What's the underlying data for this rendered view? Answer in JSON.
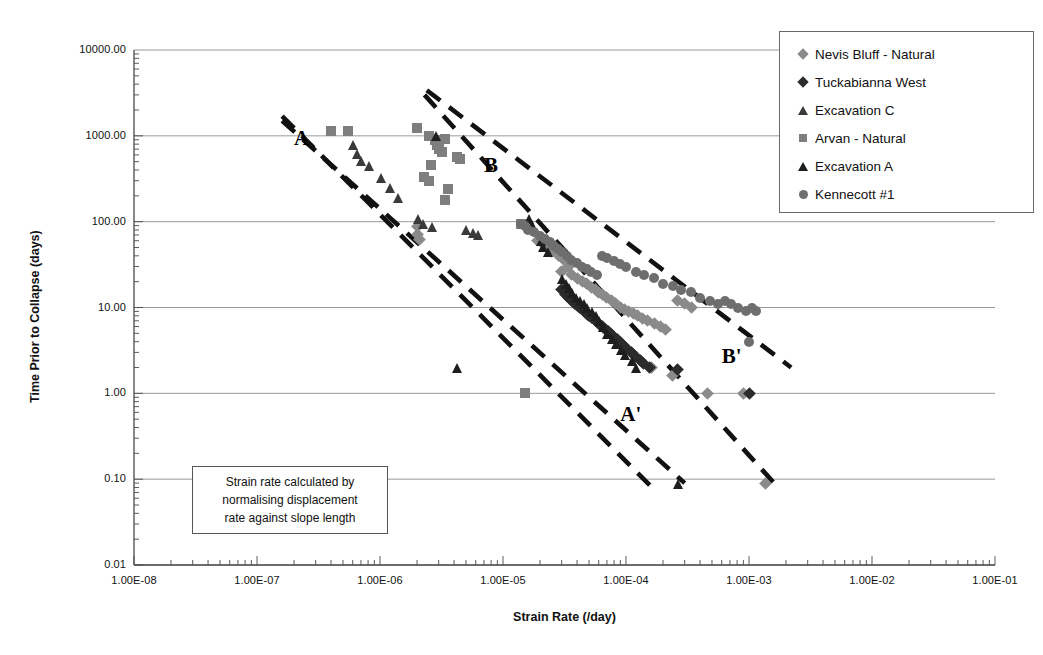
{
  "chart_data": {
    "type": "scatter",
    "title": "",
    "xlabel": "Strain Rate (/day)",
    "ylabel": "Time Prior to Collapse (days)",
    "xscale": "log",
    "yscale": "log",
    "xlim": [
      1e-08,
      0.1
    ],
    "ylim": [
      0.01,
      10000
    ],
    "grid": "horizontal-major",
    "legend_position": "top-right",
    "xtick_labels": [
      "1.00E-08",
      "1.00E-07",
      "1.00E-06",
      "1.00E-05",
      "1.00E-04",
      "1.00E-03",
      "1.00E-02",
      "1.00E-01"
    ],
    "xtick_values": [
      1e-08,
      1e-07,
      1e-06,
      1e-05,
      0.0001,
      0.001,
      0.01,
      0.1
    ],
    "ytick_labels": [
      "10000.00",
      "1000.00",
      "100.00",
      "10.00",
      "1.00",
      "0.10",
      "0.01"
    ],
    "ytick_values": [
      10000,
      1000,
      100,
      10,
      1,
      0.1,
      0.01
    ],
    "annotations": [
      {
        "text": "A",
        "x": 2e-07,
        "y": 900,
        "note": "upper bound line start label"
      },
      {
        "text": "B",
        "x": 7e-06,
        "y": 430,
        "note": "upper envelope line label"
      },
      {
        "text": "A'",
        "x": 9e-05,
        "y": 0.55,
        "note": "lower end of line A"
      },
      {
        "text": "B'",
        "x": 0.0006,
        "y": 2.6,
        "note": "lower end of line B"
      }
    ],
    "trend_lines": [
      {
        "name": "A-A'",
        "style": "dashed",
        "points": [
          [
            1.6e-07,
            1700
          ],
          [
            0.00017,
            0.075
          ]
        ]
      },
      {
        "name": "A-A'-lower",
        "style": "dashed",
        "points": [
          [
            1.6e-07,
            1500
          ],
          [
            0.0003,
            0.09
          ]
        ]
      },
      {
        "name": "B-B'",
        "style": "dashed",
        "points": [
          [
            2.3e-06,
            3000
          ],
          [
            0.0016,
            0.09
          ]
        ]
      },
      {
        "name": "B-B'-upper",
        "style": "dashed",
        "points": [
          [
            2.4e-06,
            3400
          ],
          [
            0.0022,
            2.0
          ]
        ]
      }
    ],
    "series": [
      {
        "name": "Nevis Bluff - Natural",
        "marker": "diamond",
        "color": "#8a8a8a",
        "points": [
          [
            2e-06,
            88
          ],
          [
            2e-06,
            70
          ],
          [
            2.1e-06,
            62
          ],
          [
            1.9e-05,
            60
          ],
          [
            2.2e-05,
            52
          ],
          [
            2.5e-05,
            45
          ],
          [
            2.8e-05,
            40
          ],
          [
            3.1e-05,
            36
          ],
          [
            3.4e-05,
            30
          ],
          [
            3e-05,
            26
          ],
          [
            3.6e-05,
            24
          ],
          [
            4e-05,
            22
          ],
          [
            4.4e-05,
            20
          ],
          [
            4.8e-05,
            19
          ],
          [
            5.2e-05,
            17
          ],
          [
            5.6e-05,
            16
          ],
          [
            6e-05,
            15
          ],
          [
            6.5e-05,
            14
          ],
          [
            7e-05,
            13
          ],
          [
            7.6e-05,
            12
          ],
          [
            8.2e-05,
            11
          ],
          [
            9e-05,
            10
          ],
          [
            9.8e-05,
            9.5
          ],
          [
            0.000105,
            9.0
          ],
          [
            0.000115,
            8.5
          ],
          [
            0.000125,
            8.0
          ],
          [
            0.000135,
            7.5
          ],
          [
            0.00015,
            7.0
          ],
          [
            0.00017,
            6.5
          ],
          [
            0.00019,
            6.0
          ],
          [
            0.00021,
            5.5
          ],
          [
            0.00011,
            3.0
          ],
          [
            0.00012,
            2.7
          ],
          [
            0.00016,
            2.0
          ],
          [
            0.00024,
            1.6
          ],
          [
            0.00046,
            1.0
          ],
          [
            0.0009,
            1.0
          ],
          [
            0.00135,
            0.09
          ],
          [
            0.00026,
            12
          ],
          [
            0.0003,
            11
          ],
          [
            0.00034,
            10
          ]
        ]
      },
      {
        "name": "Tuckabianna West",
        "marker": "diamond",
        "color": "#2b2b2b",
        "points": [
          [
            3e-05,
            16
          ],
          [
            3.2e-05,
            14
          ],
          [
            3.4e-05,
            13
          ],
          [
            3.6e-05,
            12
          ],
          [
            3.8e-05,
            11
          ],
          [
            4e-05,
            10.5
          ],
          [
            4.2e-05,
            10
          ],
          [
            4.4e-05,
            9.5
          ],
          [
            4.6e-05,
            9.0
          ],
          [
            4.8e-05,
            8.5
          ],
          [
            5e-05,
            8.0
          ],
          [
            5.2e-05,
            7.6
          ],
          [
            5.5e-05,
            7.2
          ],
          [
            5.8e-05,
            6.8
          ],
          [
            6.1e-05,
            6.4
          ],
          [
            6.4e-05,
            6.0
          ],
          [
            6.8e-05,
            5.6
          ],
          [
            7.2e-05,
            5.2
          ],
          [
            7.6e-05,
            4.8
          ],
          [
            8e-05,
            4.5
          ],
          [
            8.5e-05,
            4.2
          ],
          [
            9e-05,
            3.9
          ],
          [
            9.5e-05,
            3.6
          ],
          [
            0.0001,
            3.3
          ],
          [
            0.00011,
            3.0
          ],
          [
            0.00012,
            2.7
          ],
          [
            0.00013,
            2.4
          ],
          [
            0.00014,
            2.2
          ],
          [
            0.000155,
            2.0
          ],
          [
            0.00026,
            1.9
          ],
          [
            0.001,
            1.0
          ]
        ]
      },
      {
        "name": "Excavation C",
        "marker": "triangle",
        "color": "#3a3a3a",
        "points": [
          [
            6e-07,
            800
          ],
          [
            6.5e-07,
            620
          ],
          [
            7e-07,
            520
          ],
          [
            8e-07,
            450
          ],
          [
            1e-06,
            330
          ],
          [
            1.2e-06,
            250
          ],
          [
            1.4e-06,
            190
          ],
          [
            2e-06,
            110
          ],
          [
            2.2e-06,
            95
          ],
          [
            2.6e-06,
            88
          ],
          [
            5e-06,
            80
          ],
          [
            5.6e-06,
            75
          ],
          [
            6.2e-06,
            70
          ]
        ]
      },
      {
        "name": "Arvan - Natural",
        "marker": "square",
        "color": "#7e7e7e",
        "points": [
          [
            4e-07,
            1150
          ],
          [
            5.5e-07,
            1150
          ],
          [
            2e-06,
            1250
          ],
          [
            2.5e-06,
            1000
          ],
          [
            2.8e-06,
            900
          ],
          [
            2.9e-06,
            780
          ],
          [
            3.4e-06,
            920
          ],
          [
            3e-06,
            700
          ],
          [
            3.2e-06,
            640
          ],
          [
            4.2e-06,
            560
          ],
          [
            4.5e-06,
            540
          ],
          [
            2.6e-06,
            460
          ],
          [
            2.3e-06,
            330
          ],
          [
            2.5e-06,
            300
          ],
          [
            3.6e-06,
            240
          ],
          [
            3.4e-06,
            180
          ],
          [
            1.4e-05,
            95
          ],
          [
            1.5e-05,
            1.0
          ]
        ]
      },
      {
        "name": "Excavation A",
        "marker": "triangle",
        "color": "#1e1e1e",
        "points": [
          [
            2.8e-06,
            1000
          ],
          [
            1.6e-05,
            110
          ],
          [
            1.7e-05,
            92
          ],
          [
            2e-05,
            60
          ],
          [
            2.1e-05,
            52
          ],
          [
            2.3e-05,
            45
          ],
          [
            3e-05,
            22
          ],
          [
            3.2e-05,
            19
          ],
          [
            3.4e-05,
            17
          ],
          [
            3.6e-05,
            15
          ],
          [
            3.9e-05,
            13
          ],
          [
            4.2e-05,
            12
          ],
          [
            4.5e-05,
            11
          ],
          [
            4.8e-05,
            10
          ],
          [
            5.2e-05,
            9
          ],
          [
            5.6e-05,
            8
          ],
          [
            6e-05,
            7
          ],
          [
            6.5e-05,
            6
          ],
          [
            7e-05,
            5
          ],
          [
            7.6e-05,
            4.4
          ],
          [
            8.2e-05,
            3.8
          ],
          [
            9e-05,
            3.2
          ],
          [
            9.8e-05,
            2.8
          ],
          [
            0.00011,
            2.4
          ],
          [
            0.00012,
            2.0
          ],
          [
            4.2e-06,
            2.0
          ],
          [
            0.00026,
            0.09
          ]
        ]
      },
      {
        "name": "Kennecott #1",
        "marker": "circle",
        "color": "#6e6e6e",
        "points": [
          [
            1.4e-05,
            95
          ],
          [
            1.5e-05,
            88
          ],
          [
            1.6e-05,
            80
          ],
          [
            1.8e-05,
            75
          ],
          [
            2e-05,
            68
          ],
          [
            2.2e-05,
            62
          ],
          [
            2.4e-05,
            58
          ],
          [
            2.6e-05,
            52
          ],
          [
            2.8e-05,
            48
          ],
          [
            3e-05,
            44
          ],
          [
            3.3e-05,
            40
          ],
          [
            3.6e-05,
            36
          ],
          [
            4e-05,
            33
          ],
          [
            4.4e-05,
            30
          ],
          [
            4.8e-05,
            28
          ],
          [
            5.2e-05,
            26
          ],
          [
            5.8e-05,
            24
          ],
          [
            6.4e-05,
            40
          ],
          [
            7e-05,
            38
          ],
          [
            8e-05,
            35
          ],
          [
            9e-05,
            32
          ],
          [
            0.0001,
            30
          ],
          [
            0.00012,
            26
          ],
          [
            0.00014,
            24
          ],
          [
            0.00017,
            22
          ],
          [
            0.0002,
            19
          ],
          [
            0.00024,
            18
          ],
          [
            0.00028,
            16
          ],
          [
            0.00034,
            15
          ],
          [
            0.0004,
            13
          ],
          [
            0.00048,
            12
          ],
          [
            0.00056,
            11
          ],
          [
            0.00064,
            12
          ],
          [
            0.00072,
            11
          ],
          [
            0.00082,
            10
          ],
          [
            0.00094,
            9
          ],
          [
            0.00105,
            10
          ],
          [
            0.00115,
            9
          ],
          [
            0.001,
            4.0
          ]
        ]
      }
    ]
  },
  "axes": {
    "y_title": "Time Prior to Collapse (days)",
    "x_title": "Strain Rate (/day)"
  },
  "legend": {
    "items": [
      {
        "label": "Nevis Bluff - Natural",
        "marker": "diamond",
        "color": "#8a8a8a"
      },
      {
        "label": "Tuckabianna West",
        "marker": "diamond",
        "color": "#2b2b2b"
      },
      {
        "label": "Excavation C",
        "marker": "triangle",
        "color": "#3a3a3a"
      },
      {
        "label": "Arvan - Natural",
        "marker": "square",
        "color": "#7e7e7e"
      },
      {
        "label": "Excavation A",
        "marker": "triangle",
        "color": "#1e1e1e"
      },
      {
        "label": "Kennecott #1",
        "marker": "circle",
        "color": "#6e6e6e"
      }
    ]
  },
  "note_box": {
    "lines": [
      "Strain rate calculated by",
      "normalising displacement",
      "rate against slope length"
    ]
  }
}
